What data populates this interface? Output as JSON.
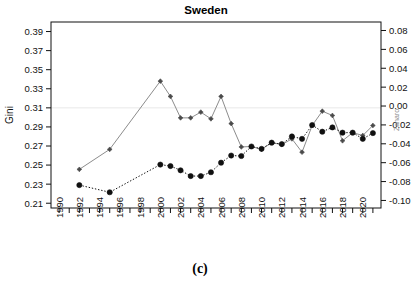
{
  "chart_data": {
    "type": "line",
    "title": "Sweden",
    "caption": "(c)",
    "xlabel": "",
    "ylabel": "Gini",
    "ylabel_right": "Zanaro",
    "xlim": [
      1989.2,
      2021.8
    ],
    "ylim": [
      0.205,
      0.4
    ],
    "ylim_right": [
      -0.108,
      0.089
    ],
    "grid": false,
    "legend": "none",
    "y_ticks": [
      "0.39",
      "0.37",
      "0.35",
      "0.33",
      "0.31",
      "0.29",
      "0.27",
      "0.25",
      "0.23",
      "0.21"
    ],
    "y_tick_values": [
      0.39,
      0.37,
      0.35,
      0.33,
      0.31,
      0.29,
      0.27,
      0.25,
      0.23,
      0.21
    ],
    "y_ticks_right": [
      "0.08",
      "0.06",
      "0.04",
      "0.02",
      "0.00",
      "-0.02",
      "-0.04",
      "-0.06",
      "-0.08",
      "-0.10"
    ],
    "y_tick_values_right": [
      0.08,
      0.06,
      0.04,
      0.02,
      0.0,
      -0.02,
      -0.04,
      -0.06,
      -0.08,
      -0.1
    ],
    "x_ticks": [
      "1990",
      "1992",
      "1994",
      "1996",
      "1998",
      "2000",
      "2002",
      "2004",
      "2006",
      "2008",
      "2010",
      "2012",
      "2014",
      "2016",
      "2018",
      "2020"
    ],
    "x_tick_values": [
      1990,
      1992,
      1994,
      1996,
      1998,
      2000,
      2002,
      2004,
      2006,
      2008,
      2010,
      2012,
      2014,
      2016,
      2018,
      2020
    ],
    "x_minor_ticks": [
      1990,
      1991,
      1992,
      1993,
      1994,
      1995,
      1996,
      1997,
      1998,
      1999,
      2000,
      2001,
      2002,
      2003,
      2004,
      2005,
      2006,
      2007,
      2008,
      2009,
      2010,
      2011,
      2012,
      2013,
      2014,
      2015,
      2016,
      2017,
      2018,
      2019,
      2020,
      2021
    ],
    "hline_at": 0.31,
    "series": [
      {
        "name": "gini-gray-series",
        "color": "#8c8c8c",
        "marker": "diamond",
        "linestyle": "solid",
        "x": [
          1992,
          1995,
          2000,
          2001,
          2002,
          2003,
          2004,
          2005,
          2006,
          2007,
          2008,
          2009,
          2010,
          2011,
          2012,
          2013,
          2014,
          2015,
          2016,
          2017,
          2018,
          2019,
          2020,
          2021
        ],
        "values": [
          0.2455,
          0.2665,
          0.338,
          0.322,
          0.2995,
          0.2995,
          0.3055,
          0.2985,
          0.322,
          0.2935,
          0.269,
          0.2695,
          0.2665,
          0.2735,
          0.2715,
          0.2775,
          0.2635,
          0.2915,
          0.3065,
          0.302,
          0.2755,
          0.284,
          0.281,
          0.2915
        ]
      },
      {
        "name": "gini-black-series",
        "color": "#101010",
        "marker": "circle",
        "linestyle": "dotted",
        "x": [
          1992,
          1995,
          2000,
          2001,
          2002,
          2003,
          2004,
          2005,
          2006,
          2007,
          2008,
          2009,
          2010,
          2011,
          2012,
          2013,
          2014,
          2015,
          2016,
          2017,
          2018,
          2019,
          2020,
          2021
        ],
        "values": [
          0.229,
          0.2215,
          0.2505,
          0.249,
          0.2445,
          0.2385,
          0.2385,
          0.2425,
          0.2525,
          0.26,
          0.2595,
          0.2695,
          0.267,
          0.2735,
          0.272,
          0.28,
          0.2775,
          0.292,
          0.285,
          0.2895,
          0.284,
          0.284,
          0.2775,
          0.2835
        ]
      }
    ]
  }
}
